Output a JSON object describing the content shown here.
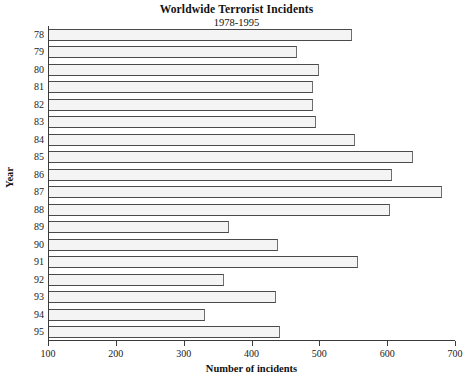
{
  "chart_data": {
    "type": "bar",
    "orientation": "horizontal",
    "title": "Worldwide Terrorist Incidents",
    "subtitle": "1978-1995",
    "xlabel": "Number of incidents",
    "ylabel": "Year",
    "xlim": [
      100,
      700
    ],
    "xticks": [
      100,
      200,
      300,
      400,
      500,
      600,
      700
    ],
    "xtick_labels": [
      "100",
      "200",
      "300",
      "400",
      "500",
      "600",
      "700"
    ],
    "grid": false,
    "legend": null,
    "categories": [
      "78",
      "79",
      "80",
      "81",
      "82",
      "83",
      "84",
      "85",
      "86",
      "87",
      "88",
      "89",
      "90",
      "91",
      "92",
      "93",
      "94",
      "95"
    ],
    "values": [
      547,
      466,
      498,
      489,
      489,
      494,
      551,
      636,
      605,
      680,
      603,
      365,
      437,
      555,
      358,
      434,
      330,
      440
    ],
    "series": [
      {
        "name": "Incidents",
        "values": [
          547,
          466,
          498,
          489,
          489,
          494,
          551,
          636,
          605,
          680,
          603,
          365,
          437,
          555,
          358,
          434,
          330,
          440
        ]
      }
    ],
    "bar_fill_color": "#f4f4f4",
    "bar_edge_color": "#4a4a4a",
    "background_color": "#ffffff",
    "axis_color": "#3a3a3a"
  }
}
